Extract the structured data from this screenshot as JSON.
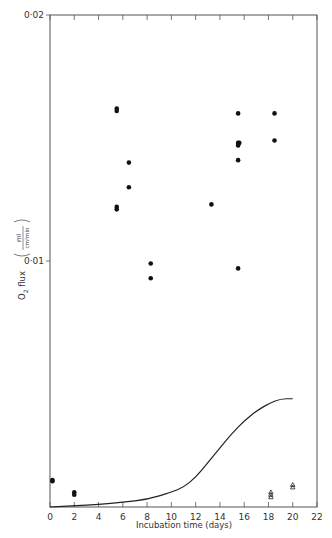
{
  "chart_data": {
    "type": "scatter",
    "title": "",
    "xlabel": "Incubation time (days)",
    "ylabel": "O2 flux (ml / cm2 min)",
    "ylabel_parts": {
      "main": "O",
      "sub": "2",
      "word": " flux",
      "unit_num": "ml",
      "unit_den": "cm²min"
    },
    "xlim": [
      0,
      22
    ],
    "ylim": [
      0,
      0.02
    ],
    "x_ticks": [
      0,
      2,
      4,
      6,
      8,
      10,
      12,
      14,
      16,
      18,
      20,
      22
    ],
    "x_tick_labels": [
      "0",
      "2",
      "4",
      "6",
      "8",
      "10",
      "12",
      "14",
      "16",
      "18",
      "20",
      "22"
    ],
    "y_ticks": [
      0.01,
      0.02
    ],
    "y_tick_labels": [
      "0·01",
      "0·02"
    ],
    "grid": false,
    "series": [
      {
        "name": "filled circles",
        "marker": "circle-filled",
        "points": [
          [
            0.2,
            0.0011
          ],
          [
            0.2,
            0.00105
          ],
          [
            2.0,
            0.0006
          ],
          [
            2.0,
            0.0005
          ],
          [
            5.5,
            0.0162
          ],
          [
            5.5,
            0.0161
          ],
          [
            5.5,
            0.0122
          ],
          [
            5.5,
            0.0121
          ],
          [
            6.5,
            0.014
          ],
          [
            6.5,
            0.013
          ],
          [
            8.3,
            0.0099
          ],
          [
            8.3,
            0.0093
          ],
          [
            13.3,
            0.0123
          ],
          [
            15.5,
            0.016
          ],
          [
            15.5,
            0.0148
          ],
          [
            15.6,
            0.0148
          ],
          [
            15.5,
            0.0147
          ],
          [
            15.5,
            0.0141
          ],
          [
            15.5,
            0.0097
          ],
          [
            18.5,
            0.016
          ],
          [
            18.5,
            0.0149
          ]
        ]
      },
      {
        "name": "open triangles",
        "marker": "triangle-open",
        "points": [
          [
            18.2,
            0.0006
          ],
          [
            18.2,
            0.0005
          ],
          [
            18.2,
            0.0004
          ],
          [
            20.0,
            0.0009
          ],
          [
            20.0,
            0.0008
          ]
        ]
      },
      {
        "name": "curve",
        "type": "line",
        "x": [
          0,
          2,
          4,
          6,
          8,
          10,
          11,
          12,
          13,
          14,
          15,
          16,
          17,
          18,
          19,
          20
        ],
        "y": [
          0,
          5e-05,
          0.0001,
          0.0002,
          0.0003,
          0.0006,
          0.0008,
          0.0012,
          0.0018,
          0.0024,
          0.003,
          0.0035,
          0.0039,
          0.0042,
          0.0044,
          0.0044
        ]
      }
    ]
  }
}
